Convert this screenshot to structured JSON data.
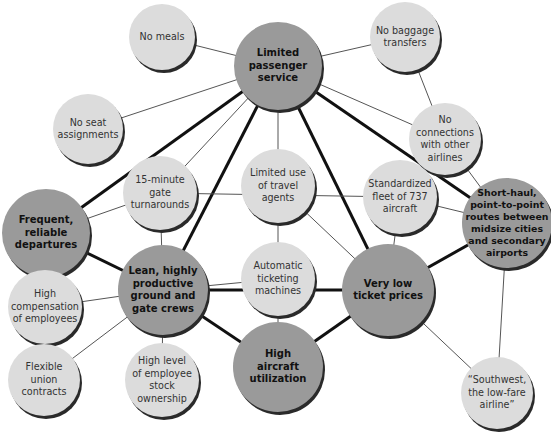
{
  "diagram": {
    "title": "",
    "colors": {
      "major_fill": "#9a9a9a",
      "minor_fill": "#dcdcdc",
      "edge": "#111111",
      "thin_edge": "#555555",
      "shadow": "#2a2a2a"
    },
    "nodes": [
      {
        "id": "no_meals",
        "label": "No meals",
        "type": "minor",
        "x": 162,
        "y": 37,
        "r": 33
      },
      {
        "id": "limited_service",
        "label": "Limited\npassenger\nservice",
        "type": "major",
        "x": 278,
        "y": 66,
        "r": 44
      },
      {
        "id": "no_baggage",
        "label": "No baggage\ntransfers",
        "type": "minor",
        "x": 405,
        "y": 37,
        "r": 35
      },
      {
        "id": "no_seat",
        "label": "No seat\nassignments",
        "type": "minor",
        "x": 88,
        "y": 129,
        "r": 35
      },
      {
        "id": "no_connections",
        "label": "No\nconnections\nwith other\nairlines",
        "type": "minor",
        "x": 445,
        "y": 139,
        "r": 36
      },
      {
        "id": "limited_travel",
        "label": "Limited use\nof travel\nagents",
        "type": "minor",
        "x": 278,
        "y": 186,
        "r": 37
      },
      {
        "id": "standardized",
        "label": "Standardized\nfleet of 737\naircraft",
        "type": "minor",
        "x": 400,
        "y": 197,
        "r": 37
      },
      {
        "id": "frequent",
        "label": "Frequent,\nreliable\ndepartures",
        "type": "major",
        "x": 46,
        "y": 233,
        "r": 44
      },
      {
        "id": "turnarounds",
        "label": "15-minute\ngate\nturnarounds",
        "type": "minor",
        "x": 160,
        "y": 193,
        "r": 37
      },
      {
        "id": "shorthaul",
        "label": "Short-haul,\npoint-to-point\nroutes between\nmidsize cities\nand secondary\nairports",
        "type": "major",
        "x": 507,
        "y": 223,
        "r": 45
      },
      {
        "id": "automatic",
        "label": "Automatic\nticketing\nmachines",
        "type": "minor",
        "x": 278,
        "y": 279,
        "r": 37
      },
      {
        "id": "lean",
        "label": "Lean, highly\nproductive\nground and\ngate crews",
        "type": "major",
        "x": 163,
        "y": 290,
        "r": 45
      },
      {
        "id": "very_low",
        "label": "Very low\nticket prices",
        "type": "major",
        "x": 388,
        "y": 290,
        "r": 46
      },
      {
        "id": "high_comp",
        "label": "High\ncompensation\nof employees",
        "type": "minor",
        "x": 45,
        "y": 307,
        "r": 37
      },
      {
        "id": "high_util",
        "label": "High\naircraft\nutilization",
        "type": "major",
        "x": 278,
        "y": 367,
        "r": 45
      },
      {
        "id": "flexible",
        "label": "Flexible\nunion\ncontracts",
        "type": "minor",
        "x": 44,
        "y": 380,
        "r": 36
      },
      {
        "id": "stock",
        "label": "High level\nof employee\nstock\nownership",
        "type": "minor",
        "x": 162,
        "y": 380,
        "r": 37
      },
      {
        "id": "southwest",
        "label": "“Southwest,\nthe low-fare\nairline”",
        "type": "minor",
        "x": 497,
        "y": 393,
        "r": 36
      }
    ],
    "edges": [
      {
        "from": "limited_service",
        "to": "frequent",
        "weight": "thick"
      },
      {
        "from": "limited_service",
        "to": "lean",
        "weight": "thick"
      },
      {
        "from": "limited_service",
        "to": "very_low",
        "weight": "thick"
      },
      {
        "from": "limited_service",
        "to": "shorthaul",
        "weight": "thick"
      },
      {
        "from": "lean",
        "to": "frequent",
        "weight": "thick"
      },
      {
        "from": "lean",
        "to": "very_low",
        "weight": "thick"
      },
      {
        "from": "lean",
        "to": "high_util",
        "weight": "thick"
      },
      {
        "from": "very_low",
        "to": "high_util",
        "weight": "thick"
      },
      {
        "from": "very_low",
        "to": "shorthaul",
        "weight": "thick"
      },
      {
        "from": "limited_service",
        "to": "no_meals",
        "weight": "thin"
      },
      {
        "from": "limited_service",
        "to": "no_baggage",
        "weight": "thin"
      },
      {
        "from": "limited_service",
        "to": "no_seat",
        "weight": "thin"
      },
      {
        "from": "limited_service",
        "to": "no_connections",
        "weight": "thin"
      },
      {
        "from": "limited_service",
        "to": "limited_travel",
        "weight": "thin"
      },
      {
        "from": "limited_service",
        "to": "turnarounds",
        "weight": "thin"
      },
      {
        "from": "no_baggage",
        "to": "no_connections",
        "weight": "thin"
      },
      {
        "from": "no_connections",
        "to": "shorthaul",
        "weight": "thin"
      },
      {
        "from": "limited_travel",
        "to": "automatic",
        "weight": "thin"
      },
      {
        "from": "limited_travel",
        "to": "very_low",
        "weight": "thin"
      },
      {
        "from": "turnarounds",
        "to": "frequent",
        "weight": "thin"
      },
      {
        "from": "turnarounds",
        "to": "lean",
        "weight": "thin"
      },
      {
        "from": "turnarounds",
        "to": "standardized",
        "weight": "thin"
      },
      {
        "from": "standardized",
        "to": "shorthaul",
        "weight": "thin"
      },
      {
        "from": "standardized",
        "to": "very_low",
        "weight": "thin"
      },
      {
        "from": "automatic",
        "to": "lean",
        "weight": "thin"
      },
      {
        "from": "automatic",
        "to": "high_util",
        "weight": "thin"
      },
      {
        "from": "lean",
        "to": "high_comp",
        "weight": "thin"
      },
      {
        "from": "lean",
        "to": "flexible",
        "weight": "thin"
      },
      {
        "from": "lean",
        "to": "stock",
        "weight": "thin"
      },
      {
        "from": "very_low",
        "to": "southwest",
        "weight": "thin"
      },
      {
        "from": "shorthaul",
        "to": "southwest",
        "weight": "thin"
      }
    ]
  }
}
